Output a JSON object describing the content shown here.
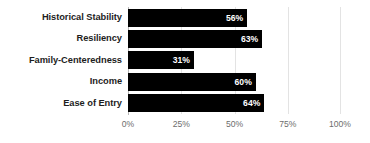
{
  "chart_data": {
    "type": "bar",
    "orientation": "horizontal",
    "title": "",
    "subtitle": "",
    "xlabel": "",
    "ylabel": "",
    "categories": [
      "Historical Stability",
      "Resiliency",
      "Family-Centeredness",
      "Income",
      "Ease of Entry"
    ],
    "values": [
      56,
      63,
      31,
      60,
      64
    ],
    "value_labels": [
      "56%",
      "63%",
      "31%",
      "60%",
      "64%"
    ],
    "xlim": [
      0,
      100
    ],
    "xtick_values": [
      0,
      25,
      50,
      75,
      100
    ],
    "xtick_labels": [
      "0%",
      "25%",
      "50%",
      "75%",
      "100%"
    ],
    "grid": "vertical",
    "legend": "none",
    "annotations": [],
    "series": [
      {
        "name": "",
        "values": [
          56,
          63,
          31,
          60,
          64
        ]
      }
    ]
  },
  "style": {
    "bar_color": "#000000",
    "value_label_color": "#ffffff",
    "category_label_color": "#1d1d1d",
    "tick_label_color": "#6d6d6d",
    "gridline_color": "#e3e3e3",
    "axis_line_color": "#b6b6b6",
    "background_color": "#ffffff"
  }
}
